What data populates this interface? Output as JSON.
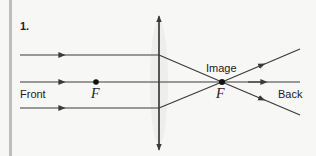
{
  "diagram": {
    "number": "1.",
    "labels": {
      "front": "Front",
      "back": "Back",
      "image": "Image",
      "focal_front": "F",
      "focal_back": "F"
    },
    "colors": {
      "line": "#3a3a3a",
      "background": "#f7f7f6",
      "left_bar": "#bdbdbd"
    }
  }
}
